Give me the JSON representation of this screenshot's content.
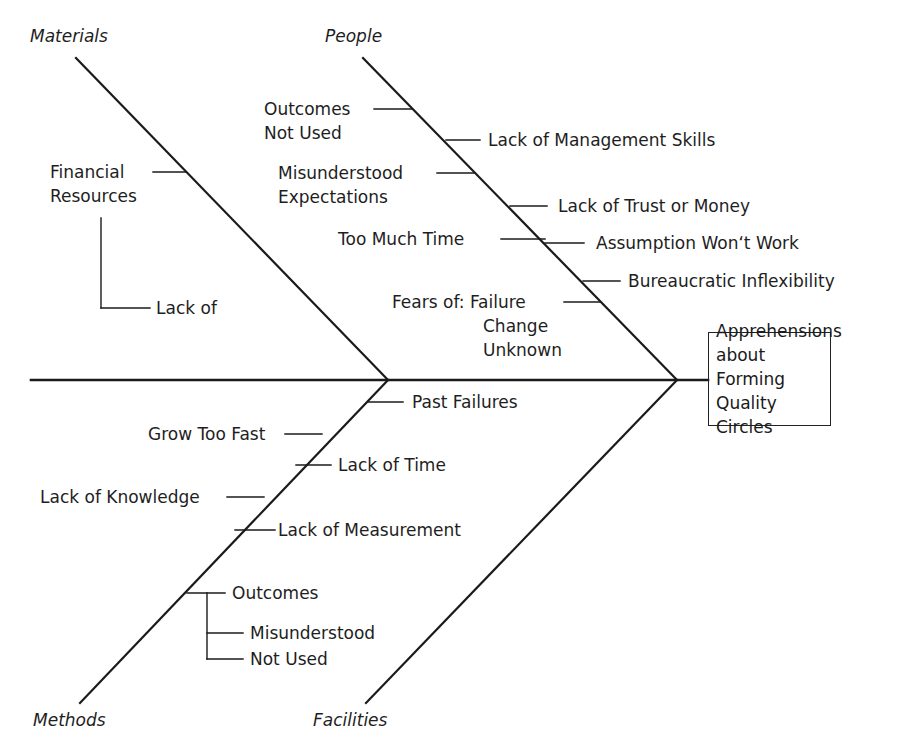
{
  "effect": {
    "lines": [
      "Apprehensions",
      "about Forming",
      "Quality Circles"
    ]
  },
  "categories": {
    "materials": "Materials",
    "people": "People",
    "methods": "Methods",
    "facilities": "Facilities"
  },
  "causes": {
    "materials": [
      {
        "lines": [
          "Financial",
          "Resources"
        ]
      },
      {
        "lines": [
          "Lack of"
        ]
      }
    ],
    "people": [
      {
        "lines": [
          "Outcomes",
          "Not Used"
        ]
      },
      {
        "lines": [
          "Lack of Management Skills"
        ]
      },
      {
        "lines": [
          "Misunderstood",
          "Expectations"
        ]
      },
      {
        "lines": [
          "Lack of Trust or Money"
        ]
      },
      {
        "lines": [
          "Too Much Time"
        ]
      },
      {
        "lines": [
          "Assumption Won‘t Work"
        ]
      },
      {
        "lines": [
          "Bureaucratic Inflexibility"
        ]
      },
      {
        "lines": [
          "Fears of: Failure",
          "Change",
          "Unknown"
        ]
      }
    ],
    "methods": [
      {
        "lines": [
          "Past Failures"
        ]
      },
      {
        "lines": [
          "Grow Too Fast"
        ]
      },
      {
        "lines": [
          "Lack of Time"
        ]
      },
      {
        "lines": [
          "Lack of Knowledge"
        ]
      },
      {
        "lines": [
          "Lack of Measurement"
        ]
      },
      {
        "lines": [
          "Outcomes"
        ]
      },
      {
        "lines": [
          "Misunderstood"
        ]
      },
      {
        "lines": [
          "Not Used"
        ]
      }
    ],
    "facilities": []
  },
  "colors": {
    "line": "#1a1a1a",
    "background": "#ffffff"
  }
}
